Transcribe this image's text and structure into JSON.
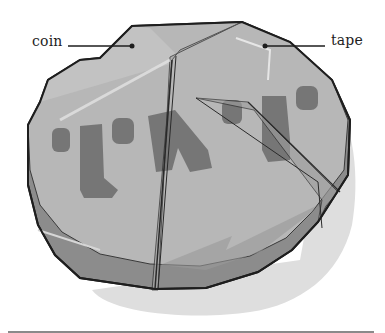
{
  "figure": {
    "labels": [
      {
        "id": "coin",
        "text": "coin"
      },
      {
        "id": "tape",
        "text": "tape"
      }
    ],
    "engraving_glyphs": "\"I\"N\"I\"",
    "colors": {
      "coin_top": "#b9b9b9",
      "coin_side": "#8f8f8f",
      "tape_overlay": "#a6a6a6",
      "engraving": "#6e6e6e",
      "outline": "#1e1e1e",
      "shadow": "#dcdcdc",
      "background": "#ffffff"
    }
  }
}
